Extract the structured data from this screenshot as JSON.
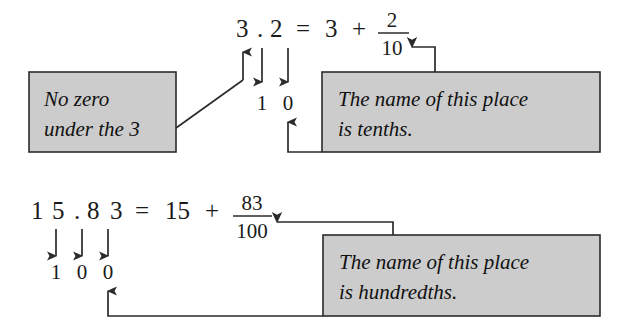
{
  "diagram": {
    "gray_fill": "#cccccc",
    "ink": "#2b2b2b",
    "rows": [
      {
        "id": "row-tenths",
        "decimal_digits": [
          "3",
          ".",
          "2"
        ],
        "equals": "=",
        "whole_part": "3",
        "plus": "+",
        "fraction": {
          "numerator": "2",
          "denominator": "10"
        },
        "place_digits": [
          "1",
          "0"
        ],
        "callout_left": {
          "line1": "No zero",
          "line2": "under the 3"
        },
        "callout_right": {
          "line1": "The name of this place",
          "line2": "is tenths."
        }
      },
      {
        "id": "row-hundredths",
        "decimal_digits": [
          "1",
          "5",
          ".",
          "8",
          "3"
        ],
        "equals": "=",
        "whole_part": "15",
        "plus": "+",
        "fraction": {
          "numerator": "83",
          "denominator": "100"
        },
        "place_digits": [
          "1",
          "0",
          "0"
        ],
        "callout_right": {
          "line1": "The name of this place",
          "line2": "is hundredths."
        }
      }
    ]
  }
}
